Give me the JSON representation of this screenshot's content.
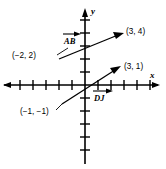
{
  "figure": {
    "type": "coordinate-plane-vector-diagram",
    "axes": {
      "x_label": "x",
      "y_label": "y",
      "origin_px": [
        85,
        85
      ],
      "unit_px": 13,
      "x_tick_count_left": 6,
      "x_tick_count_right": 6,
      "y_tick_count_up": 5,
      "y_tick_count_down": 5,
      "grid": false
    },
    "vectors": [
      {
        "name": "AB",
        "name_display": "AB",
        "has_overbar_arrow": true,
        "start_label": "(−2, 2)",
        "start_point": [
          -2,
          2
        ],
        "end_label": "(3, 4)",
        "end_point": [
          3,
          4
        ],
        "label_position": "above-left-of-midpoint"
      },
      {
        "name": "DJ",
        "name_display": "DJ",
        "has_overbar_arrow": true,
        "start_label": "(−1, −1)",
        "start_point": [
          -1,
          -1
        ],
        "end_label": "(3, 1)",
        "end_point": [
          3,
          1
        ],
        "label_position": "below-right-of-midpoint"
      }
    ],
    "colors": {
      "ink": "#000000",
      "background": "#ffffff"
    }
  }
}
